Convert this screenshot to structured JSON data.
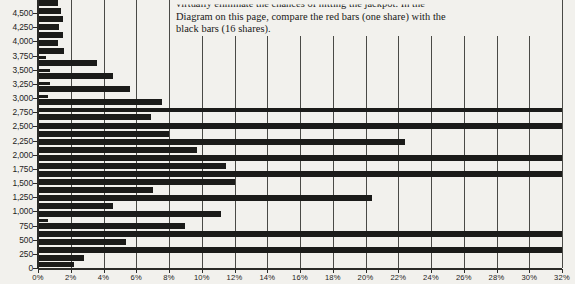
{
  "caption": {
    "line1": "virtually eliminate the chances of hitting the jackpot. In the",
    "line2": "Diagram on this page, compare the red bars (one share) with the",
    "line3": "black bars (16 shares)."
  },
  "chart_data": {
    "type": "bar",
    "orientation": "horizontal",
    "title": "",
    "xlabel": "",
    "ylabel": "",
    "xlim": [
      0,
      32
    ],
    "ylim": [
      0,
      4750
    ],
    "grid": true,
    "legend": null,
    "bar_color": "#1b1b19",
    "background": "#f2f1ed",
    "x_tick_labels": [
      "0%",
      "2%",
      "4%",
      "6%",
      "8%",
      "10%",
      "12%",
      "14%",
      "16%",
      "18%",
      "20%",
      "22%",
      "24%",
      "26%",
      "28%",
      "30%",
      "32%"
    ],
    "x_tick_values": [
      0,
      2,
      4,
      6,
      8,
      10,
      12,
      14,
      16,
      18,
      20,
      22,
      24,
      26,
      28,
      30,
      32
    ],
    "y_tick_labels": [
      "4,500",
      "4,250",
      "4,000",
      "3,750",
      "3,500",
      "3,250",
      "3,000",
      "2,750",
      "2,500",
      "2,250",
      "2,000",
      "1,750",
      "1,500",
      "1,250",
      "1,000",
      "750",
      "500",
      "250",
      "0"
    ],
    "y_tick_values": [
      4500,
      4250,
      4000,
      3750,
      3500,
      3250,
      3000,
      2750,
      2500,
      2250,
      2000,
      1750,
      1500,
      1250,
      1000,
      750,
      500,
      250,
      0
    ],
    "categories": [
      4750,
      4625,
      4500,
      4375,
      4250,
      4125,
      4000,
      3875,
      3750,
      3625,
      3500,
      3375,
      3250,
      3125,
      3000,
      2875,
      2750,
      2625,
      2500,
      2375,
      2250,
      2125,
      2000,
      1875,
      1750,
      1625,
      1500,
      1375,
      1250,
      1125,
      1000,
      875,
      750,
      625,
      500,
      375,
      250,
      125
    ],
    "values": [
      1.2,
      1.4,
      1.5,
      1.3,
      1.5,
      1.2,
      1.5,
      1.1,
      1.6,
      1.0,
      3.6,
      1.1,
      4.6,
      1.0,
      5.6,
      0.9,
      7.6,
      1.1,
      32.0,
      1.2,
      22.4,
      1.2,
      32.0,
      11.5,
      12.0,
      7.0,
      20.4,
      4.6,
      11.2,
      3.4,
      9.0,
      1.2,
      30.2,
      5.4,
      32.0,
      2.8,
      1.3,
      2.2
    ],
    "bars": [
      {
        "y_top": 0,
        "height": 5.5,
        "value": 1.2
      },
      {
        "y_top": 8,
        "height": 5.5,
        "value": 1.4
      },
      {
        "y_top": 16,
        "height": 5.5,
        "value": 1.5
      },
      {
        "y_top": 24,
        "height": 5.5,
        "value": 1.3
      },
      {
        "y_top": 32,
        "height": 5.5,
        "value": 1.5
      },
      {
        "y_top": 40,
        "height": 5.5,
        "value": 1.2
      },
      {
        "y_top": 48,
        "height": 5.5,
        "value": 1.6
      },
      {
        "y_top": 56,
        "height": 3.0,
        "value": 0.5
      },
      {
        "y_top": 60,
        "height": 5.5,
        "value": 3.6
      },
      {
        "y_top": 69,
        "height": 3.0,
        "value": 0.7
      },
      {
        "y_top": 73,
        "height": 5.5,
        "value": 4.6
      },
      {
        "y_top": 82,
        "height": 3.0,
        "value": 0.7
      },
      {
        "y_top": 86,
        "height": 5.5,
        "value": 5.6
      },
      {
        "y_top": 95,
        "height": 3.0,
        "value": 0.6
      },
      {
        "y_top": 99,
        "height": 6.0,
        "value": 7.6
      },
      {
        "y_top": 108,
        "height": 4.0,
        "value": 32.0
      },
      {
        "y_top": 114,
        "height": 6.0,
        "value": 6.9
      },
      {
        "y_top": 123,
        "height": 5.5,
        "value": 32.0
      },
      {
        "y_top": 131,
        "height": 5.5,
        "value": 8.0
      },
      {
        "y_top": 139,
        "height": 5.5,
        "value": 22.4
      },
      {
        "y_top": 147,
        "height": 5.5,
        "value": 9.7
      },
      {
        "y_top": 155,
        "height": 5.5,
        "value": 32.0
      },
      {
        "y_top": 163,
        "height": 5.5,
        "value": 11.5
      },
      {
        "y_top": 171,
        "height": 5.5,
        "value": 32.0
      },
      {
        "y_top": 179,
        "height": 5.5,
        "value": 12.0
      },
      {
        "y_top": 187,
        "height": 5.5,
        "value": 7.0
      },
      {
        "y_top": 195,
        "height": 5.5,
        "value": 20.4
      },
      {
        "y_top": 203,
        "height": 5.5,
        "value": 4.6
      },
      {
        "y_top": 211,
        "height": 5.5,
        "value": 11.2
      },
      {
        "y_top": 219,
        "height": 3.0,
        "value": 0.6
      },
      {
        "y_top": 223,
        "height": 5.5,
        "value": 9.0
      },
      {
        "y_top": 231,
        "height": 5.5,
        "value": 32.0
      },
      {
        "y_top": 239,
        "height": 5.5,
        "value": 5.4
      },
      {
        "y_top": 247,
        "height": 5.5,
        "value": 32.0
      },
      {
        "y_top": 255,
        "height": 5.5,
        "value": 2.8
      },
      {
        "y_top": 262,
        "height": 5.0,
        "value": 2.2
      }
    ]
  }
}
